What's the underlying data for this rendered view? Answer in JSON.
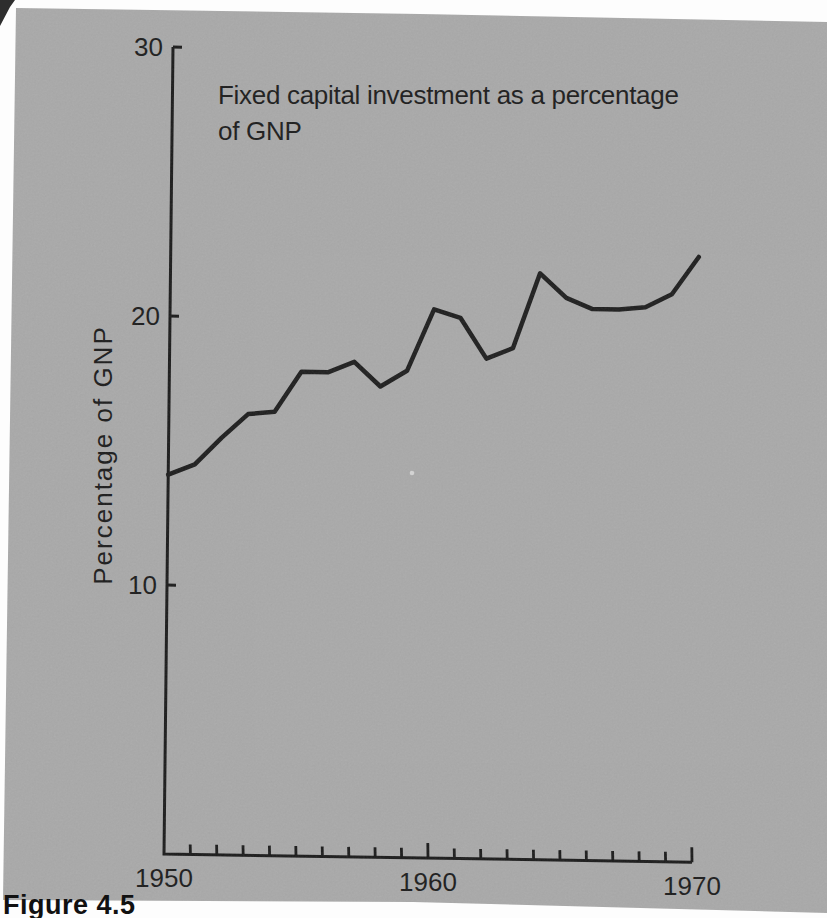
{
  "figure": {
    "title_line1": "Fixed capital investment as a percentage",
    "title_line2": "of GNP",
    "y_axis_label": "Percentage of GNP",
    "caption": "Figure 4.5"
  },
  "chart_data": {
    "type": "line",
    "title": "Fixed capital investment as a percentage of GNP",
    "xlabel": "",
    "ylabel": "Percentage of GNP",
    "series_name": "Fixed capital investment (% of GNP)",
    "x": [
      1950,
      1951,
      1952,
      1953,
      1954,
      1955,
      1956,
      1957,
      1958,
      1959,
      1960,
      1961,
      1962,
      1963,
      1964,
      1965,
      1966,
      1967,
      1968,
      1969,
      1970
    ],
    "values": [
      14.1,
      14.5,
      15.5,
      16.4,
      16.5,
      18.0,
      18.0,
      18.4,
      17.5,
      18.1,
      20.4,
      20.1,
      18.6,
      19.0,
      21.8,
      20.9,
      20.5,
      20.5,
      20.6,
      21.1,
      22.5
    ],
    "xlim": [
      1950,
      1970
    ],
    "ylim": [
      0,
      30
    ],
    "x_major_ticks": [
      1960,
      1970
    ],
    "x_tick_label_years": [
      1950,
      1960,
      1970
    ],
    "x_minor_tick_interval": 1,
    "y_ticks": [
      10,
      20,
      30
    ],
    "grid": false,
    "legend_position": "none",
    "line_color": "#1e1e1e",
    "axis_color": "#1b1b1b",
    "photo_background": "#a9a9a9",
    "page_background": "#fdfdfd"
  }
}
